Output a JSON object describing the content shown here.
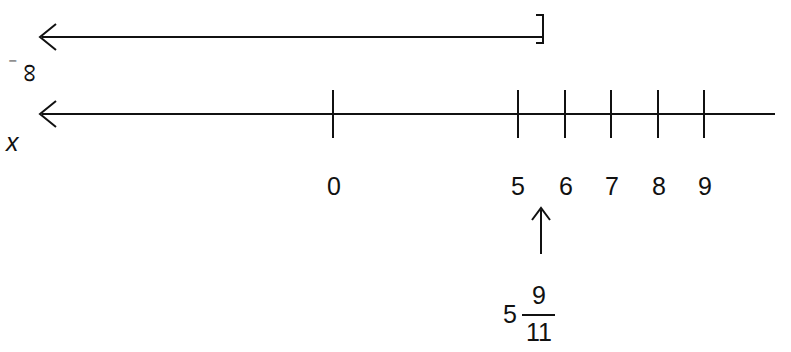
{
  "diagram": {
    "type": "number-line",
    "solution_ray": {
      "from": "-infinity",
      "to": "5 9/11",
      "left_end": "arrow",
      "right_end": "closed-bracket",
      "right_end_symbol": "]"
    },
    "neg_infinity_label": {
      "minus": "⁻",
      "infinity": "∞"
    },
    "variable_label": "x",
    "axis": {
      "left_end": "arrow",
      "ticks": [
        {
          "value": 0,
          "label": "0",
          "x": 333
        },
        {
          "value": 5,
          "label": "5",
          "x": 518
        },
        {
          "value": 6,
          "label": "6",
          "x": 565
        },
        {
          "value": 7,
          "label": "7",
          "x": 611
        },
        {
          "value": 8,
          "label": "8",
          "x": 658
        },
        {
          "value": 9,
          "label": "9",
          "x": 704
        }
      ]
    },
    "pointer": {
      "direction": "up",
      "points_to": "5 9/11",
      "whole": "5",
      "numerator": "9",
      "denominator": "11"
    }
  }
}
